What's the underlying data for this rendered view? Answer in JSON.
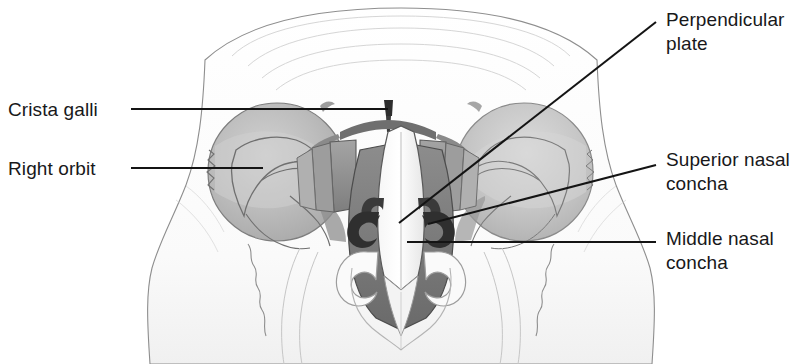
{
  "figure": {
    "view": "coronal / anterior",
    "background_color": "#ffffff",
    "ink_color": "#18181a"
  },
  "labels": {
    "crista_galli": "Crista galli",
    "right_orbit": "Right orbit",
    "perpendicular_plate": "Perpendicular\nplate",
    "superior_nasal_concha": "Superior nasal\nconcha",
    "middle_nasal_concha": "Middle nasal\nconcha"
  },
  "leaders": [
    {
      "name": "crista-galli-leader",
      "label": "Crista galli",
      "side": "left",
      "style": "horizontal",
      "x1": 131,
      "y1": 109,
      "x2": 388,
      "y2": 109
    },
    {
      "name": "right-orbit-leader",
      "label": "Right orbit",
      "side": "left",
      "style": "horizontal",
      "x1": 131,
      "y1": 168,
      "x2": 263,
      "y2": 168
    },
    {
      "name": "perpendicular-plate-leader",
      "label": "Perpendicular plate",
      "side": "right",
      "style": "diagonal",
      "x1": 656,
      "y1": 22,
      "x2": 399,
      "y2": 223
    },
    {
      "name": "superior-nasal-concha-leader",
      "label": "Superior nasal concha",
      "side": "right",
      "style": "diagonal",
      "x1": 656,
      "y1": 165,
      "x2": 428,
      "y2": 224
    },
    {
      "name": "middle-nasal-concha-leader",
      "label": "Middle nasal concha",
      "side": "right",
      "style": "horizontal",
      "x1": 656,
      "y1": 242,
      "x2": 407,
      "y2": 242
    }
  ],
  "anatomy": {
    "structures": [
      {
        "name": "frontal-bone",
        "shade": "#fbfbfb"
      },
      {
        "name": "right-orbit-cavity",
        "shade": "#b9b9b9"
      },
      {
        "name": "left-orbit-cavity",
        "shade": "#c3c3c3"
      },
      {
        "name": "crista-galli",
        "shade": "#3a3a3a"
      },
      {
        "name": "cribriform-plate",
        "shade": "#6e6e6e"
      },
      {
        "name": "perpendicular-plate",
        "shade": "#f2f2f2"
      },
      {
        "name": "ethmoidal-labyrinth",
        "shade": "#8f8f8f"
      },
      {
        "name": "superior-nasal-concha",
        "shade": "#9a9a9a"
      },
      {
        "name": "middle-nasal-concha",
        "shade": "#8a8a8a"
      },
      {
        "name": "inferior-nasal-concha",
        "shade": "#9e9e9e"
      },
      {
        "name": "nasal-cavity",
        "shade": "#707070"
      },
      {
        "name": "vomer",
        "shade": "#ededed"
      },
      {
        "name": "maxilla",
        "shade": "#fafafa"
      },
      {
        "name": "zygomatic-bone",
        "shade": "#f7f7f7"
      }
    ],
    "palette": {
      "outline": "#5d5d5d",
      "outline_dark": "#2a2a2a",
      "orbit_fill": "#bcbcbc",
      "orbit_fill_light": "#cbcbcb",
      "cavity_dark": "#6b6b6b",
      "cavity_mid": "#979797",
      "cavity_light": "#d6d6d6",
      "bone_light": "#fcfcfc",
      "bone_shadow": "#e9e9e9"
    }
  }
}
